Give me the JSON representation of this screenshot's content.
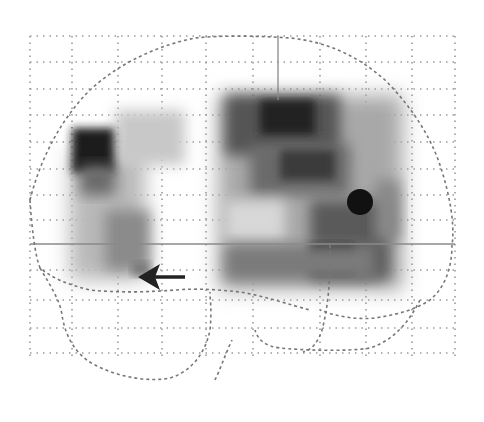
{
  "figure": {
    "type": "glass-brain-sagittal-projection",
    "width": 484,
    "height": 422,
    "background": "#ffffff",
    "grid": {
      "color": "#9a9a9a",
      "vertical_x": [
        30,
        72,
        118,
        162,
        206,
        253,
        320,
        366,
        412,
        455
      ],
      "horizontal_y": [
        36,
        62,
        89,
        115,
        142,
        169,
        195,
        220,
        270,
        300,
        328,
        353
      ],
      "x_range": [
        30,
        455
      ],
      "y_range": [
        36,
        358
      ]
    },
    "crosshair": {
      "color": "#8a8a8a",
      "vertical": {
        "x": 278,
        "y1": 36,
        "y2": 100
      },
      "horizontal": {
        "y": 244,
        "x1": 30,
        "x2": 455
      }
    },
    "outline_color": "#777777",
    "marker": {
      "shape": "circle",
      "cx": 360,
      "cy": 202,
      "r": 13,
      "color": "#111111"
    },
    "arrow": {
      "x_tail": 185,
      "x_head": 140,
      "y": 277,
      "color": "#222222",
      "direction": "left"
    }
  }
}
